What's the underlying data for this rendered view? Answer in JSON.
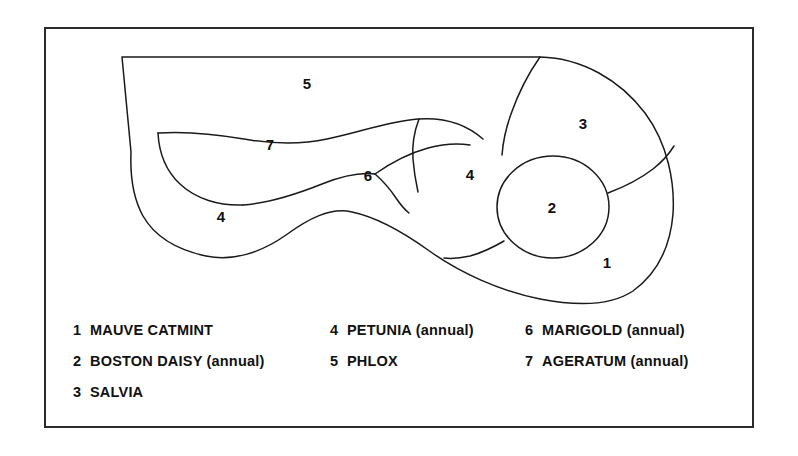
{
  "frame": {
    "border_color": "#2b2b2b",
    "background_color": "#ffffff"
  },
  "diagram": {
    "line_color": "#1a1a1a",
    "fill_color": "#ffffff",
    "regions": [
      {
        "number": "1",
        "label_x": 607,
        "label_y": 264
      },
      {
        "number": "2",
        "label_x": 552,
        "label_y": 209
      },
      {
        "number": "3",
        "label_x": 583,
        "label_y": 125
      },
      {
        "number": "4",
        "label_x": 470,
        "label_y": 176
      },
      {
        "number": "4b",
        "display": "4",
        "label_x": 221,
        "label_y": 218
      },
      {
        "number": "5",
        "label_x": 307,
        "label_y": 85
      },
      {
        "number": "6",
        "label_x": 368,
        "label_y": 177
      },
      {
        "number": "7",
        "label_x": 270,
        "label_y": 146
      }
    ]
  },
  "legend": {
    "columns": [
      {
        "items": [
          {
            "number": "1",
            "name": "MAUVE CATMINT"
          },
          {
            "number": "2",
            "name": "BOSTON DAISY (annual)"
          },
          {
            "number": "3",
            "name": "SALVIA"
          }
        ]
      },
      {
        "items": [
          {
            "number": "4",
            "name": "PETUNIA (annual)"
          },
          {
            "number": "5",
            "name": "PHLOX"
          }
        ]
      },
      {
        "items": [
          {
            "number": "6",
            "name": "MARIGOLD (annual)"
          },
          {
            "number": "7",
            "name": "AGERATUM (annual)"
          }
        ]
      }
    ]
  }
}
